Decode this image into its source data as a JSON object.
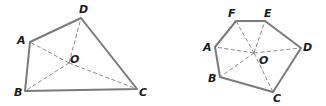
{
  "figures": [
    {
      "name": "quadrilateral",
      "vertices": [
        {
          "label": "A",
          "x": 30,
          "y": 42,
          "lx": 17,
          "ly": 44
        },
        {
          "label": "D",
          "x": 81,
          "y": 18,
          "lx": 79,
          "ly": 13
        },
        {
          "label": "C",
          "x": 137,
          "y": 89,
          "lx": 139,
          "ly": 96
        },
        {
          "label": "B",
          "x": 25,
          "y": 91,
          "lx": 14,
          "ly": 96
        }
      ],
      "center": {
        "label": "O",
        "x": 69,
        "y": 63,
        "lx": 70,
        "ly": 63
      }
    },
    {
      "name": "hexagon",
      "vertices": [
        {
          "label": "F",
          "x": 236,
          "y": 21,
          "lx": 228,
          "ly": 17
        },
        {
          "label": "E",
          "x": 265,
          "y": 21,
          "lx": 264,
          "ly": 17
        },
        {
          "label": "D",
          "x": 301,
          "y": 48,
          "lx": 303,
          "ly": 51
        },
        {
          "label": "C",
          "x": 273,
          "y": 92,
          "lx": 273,
          "ly": 102
        },
        {
          "label": "B",
          "x": 220,
          "y": 77,
          "lx": 208,
          "ly": 82
        },
        {
          "label": "A",
          "x": 215,
          "y": 47,
          "lx": 203,
          "ly": 51
        }
      ],
      "center": {
        "label": "O",
        "x": 254,
        "y": 53,
        "lx": 259,
        "ly": 64
      }
    }
  ]
}
